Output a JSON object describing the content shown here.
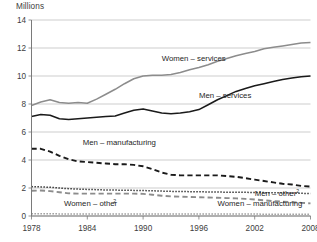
{
  "chart_data": {
    "type": "line",
    "title": "",
    "subtitle": "",
    "ylabel": "Millions",
    "xlabel": "",
    "ylim": [
      0,
      14
    ],
    "xlim": [
      1978,
      2008
    ],
    "grid": true,
    "legend_position": "inline-annotations",
    "ytick_labels": [
      "0",
      "2",
      "4",
      "6",
      "8",
      "10",
      "12",
      "14"
    ],
    "ytick_values": [
      0,
      2,
      4,
      6,
      8,
      10,
      12,
      14
    ],
    "xtick_labels": [
      "1978",
      "1984",
      "1990",
      "1996",
      "2002",
      "2008"
    ],
    "xtick_values": [
      1978,
      1984,
      1990,
      1996,
      2002,
      2008
    ],
    "x": [
      1978,
      1979,
      1980,
      1981,
      1982,
      1983,
      1984,
      1985,
      1986,
      1987,
      1988,
      1989,
      1990,
      1991,
      1992,
      1993,
      1994,
      1995,
      1996,
      1997,
      1998,
      1999,
      2000,
      2001,
      2002,
      2003,
      2004,
      2005,
      2006,
      2007,
      2008
    ],
    "series": [
      {
        "name": "Women – services",
        "label": "Women – services",
        "style": "solid",
        "color": "#8c8c8c",
        "values": [
          7.9,
          8.15,
          8.3,
          8.1,
          8.05,
          8.1,
          8.05,
          8.35,
          8.7,
          9.05,
          9.45,
          9.8,
          10.0,
          10.05,
          10.05,
          10.1,
          10.25,
          10.45,
          10.6,
          10.8,
          11.05,
          11.25,
          11.45,
          11.6,
          11.75,
          11.95,
          12.05,
          12.15,
          12.25,
          12.35,
          12.4
        ]
      },
      {
        "name": "Men – services",
        "label": "Men – services",
        "style": "solid",
        "color": "#1a1a1a",
        "values": [
          7.1,
          7.25,
          7.2,
          6.95,
          6.9,
          6.95,
          7.0,
          7.05,
          7.1,
          7.15,
          7.35,
          7.55,
          7.65,
          7.5,
          7.35,
          7.3,
          7.35,
          7.45,
          7.6,
          7.95,
          8.3,
          8.6,
          8.9,
          9.1,
          9.3,
          9.45,
          9.6,
          9.75,
          9.85,
          9.95,
          10.0
        ]
      },
      {
        "name": "Men – manufacturing",
        "label": "Men – manufacturing",
        "style": "dashed",
        "color": "#1a1a1a",
        "values": [
          4.8,
          4.8,
          4.6,
          4.3,
          4.05,
          3.9,
          3.85,
          3.8,
          3.75,
          3.7,
          3.7,
          3.65,
          3.55,
          3.35,
          3.1,
          2.95,
          2.9,
          2.9,
          2.9,
          2.9,
          2.9,
          2.85,
          2.8,
          2.7,
          2.6,
          2.5,
          2.4,
          2.3,
          2.25,
          2.15,
          2.1
        ]
      },
      {
        "name": "Men – other",
        "label": "Men – other",
        "superscript": "2",
        "style": "dotted",
        "color": "#1a1a1a",
        "values": [
          2.1,
          2.08,
          2.05,
          2.0,
          1.95,
          1.92,
          1.9,
          1.88,
          1.86,
          1.85,
          1.84,
          1.83,
          1.82,
          1.8,
          1.78,
          1.76,
          1.75,
          1.74,
          1.73,
          1.72,
          1.71,
          1.7,
          1.7,
          1.69,
          1.68,
          1.67,
          1.66,
          1.65,
          1.64,
          1.62,
          1.6
        ]
      },
      {
        "name": "Women – manufacturing",
        "label": "Women – manufacturing",
        "style": "dashed",
        "color": "#8c8c8c",
        "values": [
          1.8,
          1.82,
          1.78,
          1.7,
          1.62,
          1.6,
          1.6,
          1.6,
          1.6,
          1.6,
          1.6,
          1.6,
          1.58,
          1.52,
          1.45,
          1.4,
          1.38,
          1.36,
          1.34,
          1.32,
          1.3,
          1.28,
          1.26,
          1.22,
          1.18,
          1.12,
          1.06,
          1.02,
          0.98,
          0.94,
          0.9
        ]
      },
      {
        "name": "Women – other",
        "label": "Women – other",
        "superscript": "2",
        "style": "dotted",
        "color": "#8c8c8c",
        "values": [
          0.16,
          0.16,
          0.16,
          0.15,
          0.15,
          0.15,
          0.15,
          0.15,
          0.15,
          0.15,
          0.15,
          0.15,
          0.15,
          0.15,
          0.15,
          0.14,
          0.14,
          0.14,
          0.14,
          0.14,
          0.14,
          0.14,
          0.14,
          0.14,
          0.14,
          0.13,
          0.13,
          0.13,
          0.13,
          0.13,
          0.13
        ]
      }
    ],
    "annotations": [
      {
        "text": "Women – services",
        "x": 1992.0,
        "y": 11.05
      },
      {
        "text": "Men – services",
        "x": 1996.0,
        "y": 8.45
      },
      {
        "text": "Men – manufacturing",
        "x": 1983.5,
        "y": 5.05
      },
      {
        "text": "Men – other",
        "superscript": "2",
        "x": 2002.0,
        "y": 1.45
      },
      {
        "text": "Women – manufacturing",
        "x": 1998.0,
        "y": 0.72
      },
      {
        "text": "Women – other",
        "superscript": "2",
        "x": 1981.5,
        "y": 0.72
      }
    ]
  }
}
